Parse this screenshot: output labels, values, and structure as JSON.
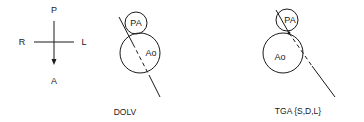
{
  "orientation": {
    "top": "P",
    "bottom": "A",
    "left": "R",
    "right": "L"
  },
  "panels": [
    {
      "caption": "DOLV",
      "circles": [
        {
          "label": "PA"
        },
        {
          "label": "Ao"
        }
      ]
    },
    {
      "caption": "TGA {S,D,L}",
      "circles": [
        {
          "label": "PA"
        },
        {
          "label": "Ao"
        }
      ]
    }
  ],
  "colors": {
    "stroke": "#1a1a1a",
    "background": "#ffffff"
  }
}
